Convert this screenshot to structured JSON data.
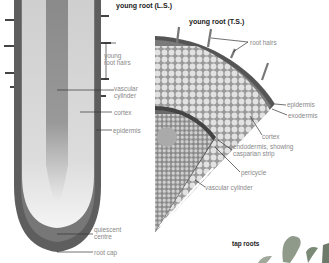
{
  "diagram": {
    "left_panel": {
      "title": "young root (L.S.)",
      "labels": {
        "root_hairs_1": "young",
        "root_hairs_2": "root hairs",
        "vascular_1": "vascular",
        "vascular_2": "cylinder",
        "cortex": "cortex",
        "epidermis": "epidermis",
        "quiescent_1": "quiescent",
        "quiescent_2": "centre",
        "root_cap": "root cap"
      }
    },
    "right_panel": {
      "title": "young root (T.S.)",
      "labels": {
        "root_hairs": "root hairs",
        "epidermis": "epidermis",
        "exodermis": "exodermis",
        "cortex": "cortex",
        "endodermis_1": "endodermis, showing",
        "endodermis_2": "casparian strip",
        "pericycle": "pericycle",
        "vascular_cylinder": "vascular cylinder"
      }
    },
    "bottom_right": {
      "title": "tap roots"
    },
    "colors": {
      "epidermis": "#555555",
      "cortex": "#c8c8c8",
      "vascular": "#8a8a8a",
      "root_cap": "#666666",
      "leaf": "#8f9a8a",
      "label_text": "#888888",
      "title_text": "#222222"
    }
  }
}
